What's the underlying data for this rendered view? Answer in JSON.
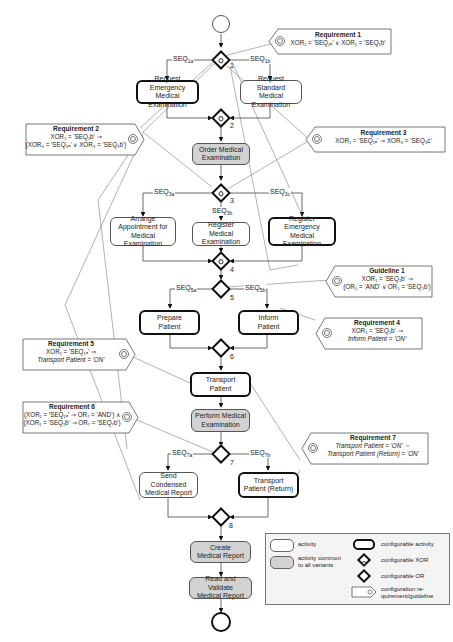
{
  "events": {
    "start": "start-event",
    "end": "end-event"
  },
  "activities": {
    "req_emergency": "Request\nEmergency Medical\nExamination",
    "req_standard": "Request\nStandard Medical\nExamination",
    "order": "Order Medical\nExamination",
    "arrange": "Arrange\nAppointment for\nMedical Examination",
    "register": "Register Medical\nExamination",
    "register_emergency": "Register\nEmergency Medical\nExamination",
    "prepare": "Prepare\nPatient",
    "inform": "Inform\nPatient",
    "transport": "Transport\nPatient",
    "perform": "Perform Medical\nExamination",
    "send_condensed": "Send Condensed\nMedical Report",
    "transport_return": "Transport\nPatient (Return)",
    "create": "Create\nMedical Report",
    "read_validate": "Read and Validate\nMedical Report"
  },
  "gateways": {
    "g1": "1",
    "g2": "2",
    "g3": "3",
    "g4": "4",
    "g5": "5",
    "g6": "6",
    "g7": "7",
    "g8": "8"
  },
  "sequences": {
    "s1a": {
      "base": "SEQ",
      "sub": "1a"
    },
    "s1b": {
      "base": "SEQ",
      "sub": "1b"
    },
    "s3a": {
      "base": "SEQ",
      "sub": "3a"
    },
    "s3b": {
      "base": "SEQ",
      "sub": "3b"
    },
    "s3c": {
      "base": "SEQ",
      "sub": "3c"
    },
    "s5a": {
      "base": "SEQ",
      "sub": "5a"
    },
    "s5b": {
      "base": "SEQ",
      "sub": "5b"
    },
    "s7a": {
      "base": "SEQ",
      "sub": "7a"
    },
    "s7b": {
      "base": "SEQ",
      "sub": "7b"
    }
  },
  "requirements": {
    "r1": {
      "title": "Requirement 1",
      "lines": [
        "XOR₁ = 'SEQ₁ₐ' ∨ XOR₁ = 'SEQ₁b'"
      ]
    },
    "r2": {
      "title": "Requirement 2",
      "lines": [
        "XOR₁ = 'SEQ₁b' ⇒",
        "(XOR₃ = 'SEQ₃ₐ' ∨ XOR₃ = 'SEQ₃b')"
      ]
    },
    "r3": {
      "title": "Requirement 3",
      "lines": [
        "XOR₁ = 'SEQ₁ₐ' ⇒ XOR₃ = 'SEQ₃c'"
      ]
    },
    "g1": {
      "title": "Guideline 1",
      "lines": [
        "XOR₁ = 'SEQ₁b' ⇒",
        "(OR₅ = 'AND' ∨ OR₅ = 'SEQ₅b')"
      ]
    },
    "r4": {
      "title": "Requirement 4",
      "lines": [
        "XOR₁ = 'SEQ₁b' ⇒",
        "Inform Patient = 'ON'"
      ]
    },
    "r5": {
      "title": "Requirement 5",
      "lines": [
        "XOR₁ = 'SEQ₁ₐ' ⇒",
        "Transport Patient = 'ON'"
      ]
    },
    "r6": {
      "title": "Requirement 6",
      "lines": [
        "(XOR₁ = 'SEQ₁ₐ' ⇒ OR₇ = 'AND') ∧",
        "(XOR₁ = 'SEQ₁b' ⇒ OR₇ = 'SEQ₇b')"
      ]
    },
    "r7": {
      "title": "Requirement 7",
      "lines": [
        "Transport Patient = 'ON' ⇔",
        "Transport Patient (Return) = 'ON'"
      ]
    }
  },
  "legend": {
    "activity": "activity",
    "common": "activity common\nto all variants",
    "cfg_activity": "configurable activity",
    "cfg_xor": "configurable XOR",
    "cfg_or": "configurable OR",
    "cfg_req": "configuration re-\nquirement/guideline"
  },
  "colors": {
    "common_fill": "#d2d2d2",
    "stroke": "#111111",
    "legend_bg": "#f4f4f4"
  }
}
